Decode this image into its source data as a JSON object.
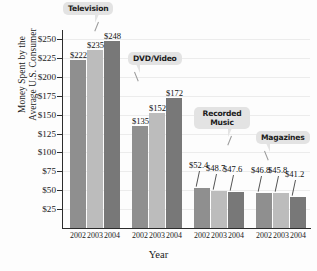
{
  "chart_data": {
    "type": "bar",
    "title": "",
    "xlabel": "Year",
    "ylabel": "Money Spent by the Average U.S. Consumer",
    "ylabel_line1": "Money Spent by the",
    "ylabel_line2": "Average U.S. Consumer",
    "ylim": [
      0,
      262
    ],
    "yticks": [
      25,
      50,
      75,
      100,
      125,
      150,
      175,
      200,
      225,
      250
    ],
    "ytick_labels": [
      "$25",
      "$50",
      "$75",
      "$100",
      "$125",
      "$150",
      "$175",
      "$200",
      "$225",
      "$250"
    ],
    "grid": true,
    "legend": "none",
    "categories": [
      "2002",
      "2003",
      "2004"
    ],
    "groups": [
      {
        "name": "Television",
        "callout": "Television",
        "values": [
          222,
          235,
          248
        ],
        "value_labels": [
          "$222",
          "$235",
          "$248"
        ]
      },
      {
        "name": "DVD/Video",
        "callout": "DVD/Video",
        "values": [
          135,
          152,
          172
        ],
        "value_labels": [
          "$135",
          "$152",
          "$172"
        ]
      },
      {
        "name": "Recorded Music",
        "callout_line1": "Recorded",
        "callout_line2": "Music",
        "values": [
          52.4,
          48.7,
          47.6
        ],
        "value_labels": [
          "$52.4",
          "$48.7",
          "$47.6"
        ]
      },
      {
        "name": "Magazines",
        "callout": "Magazines",
        "values": [
          46.8,
          45.8,
          41.2
        ],
        "value_labels": [
          "$46.8",
          "$45.8",
          "$41.2"
        ]
      }
    ],
    "series_colors": {
      "2002": "#8f8f8f",
      "2003": "#bcbcbc",
      "2004": "#787878"
    },
    "callout_bg": "#e3e3e3",
    "axis_color": "#2c2c2c",
    "grid_color": "#ececec",
    "background": "#fdfdfd"
  },
  "xtick_labels": [
    "2002",
    "2003",
    "2004",
    "2002",
    "2003",
    "2004",
    "2002",
    "2003",
    "2004",
    "2002",
    "2003",
    "2004"
  ]
}
